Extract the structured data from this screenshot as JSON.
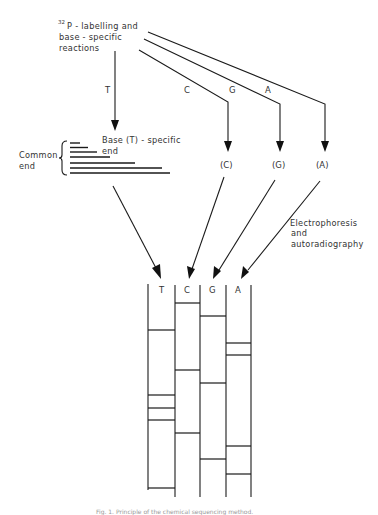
{
  "figure": {
    "top_label": {
      "superscript": "32",
      "line1": "P - labelling and",
      "line2": "base - specific",
      "line3": "reactions"
    },
    "branch_labels": {
      "T": "T",
      "C": "C",
      "G": "G",
      "A": "A"
    },
    "product_labels": {
      "C": "(C)",
      "G": "(G)",
      "A": "(A)"
    },
    "common_end_label": {
      "line1": "Common",
      "line2": "end"
    },
    "base_specific_label": {
      "line1": "Base (T) - specific",
      "line2": "end"
    },
    "process_label": {
      "line1": "Electrophoresis",
      "line2": "and",
      "line3": "autoradiography"
    },
    "gel": {
      "lanes": [
        "T",
        "C",
        "G",
        "A"
      ],
      "bands_y": {
        "T": [
          330,
          395,
          408,
          420,
          488
        ],
        "C": [
          303,
          370,
          433
        ],
        "G": [
          316,
          382,
          459
        ],
        "A": [
          343,
          355,
          446,
          474
        ]
      }
    },
    "caption": "Fig. 1. Principle of the chemical sequencing method."
  },
  "colors": {
    "line": "#1a1a1a",
    "text": "#333333",
    "background": "#ffffff"
  }
}
